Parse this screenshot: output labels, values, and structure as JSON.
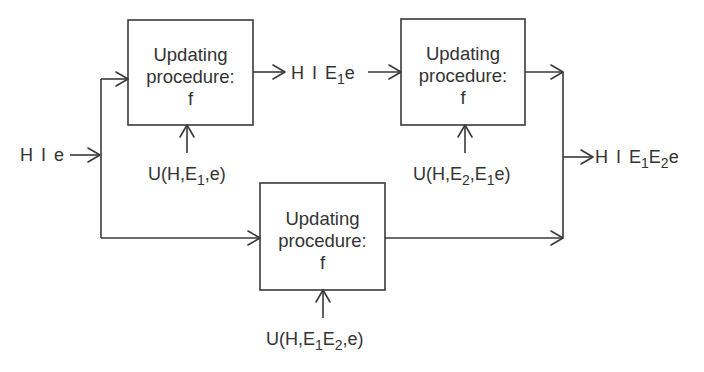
{
  "diagram": {
    "type": "flow",
    "input": {
      "base": "H I e"
    },
    "intermediate": {
      "base": "H I E",
      "sub": "1",
      "tail": "e"
    },
    "output": {
      "base": "H I E",
      "sub1": "1",
      "mid": "E",
      "sub2": "2",
      "tail": "e"
    },
    "boxes": [
      {
        "line1": "Updating",
        "line2": "procedure:",
        "line3": "f",
        "utility": {
          "pre": "U(H,E",
          "sub1": "1",
          "post": ",e)"
        }
      },
      {
        "line1": "Updating",
        "line2": "procedure:",
        "line3": "f",
        "utility": {
          "pre": "U(H,E",
          "sub1": "2",
          "mid": ",E",
          "sub2": "1",
          "post": "e)"
        }
      },
      {
        "line1": "Updating",
        "line2": "procedure:",
        "line3": "f",
        "utility": {
          "pre": "U(H,E",
          "sub1": "1",
          "mid": "E",
          "sub2": "2",
          "post": ",e)"
        }
      }
    ],
    "colors": {
      "stroke": "#3a3a3a",
      "text": "#333333",
      "background": "#ffffff"
    }
  }
}
